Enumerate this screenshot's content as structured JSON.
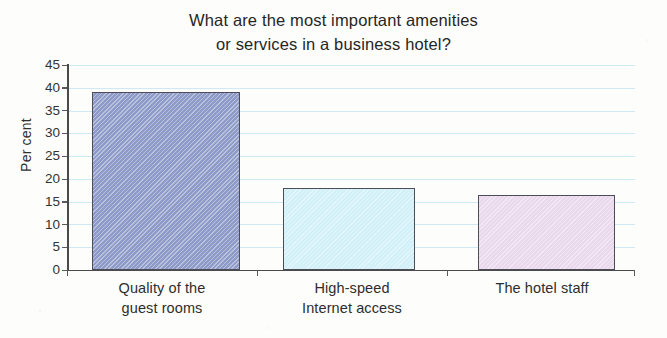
{
  "chart_data": {
    "type": "bar",
    "title": "What are the most important amenities\nor services in a business hotel?",
    "title_line1": "What are the most important amenities",
    "title_line2": "or services in a business hotel?",
    "xlabel": "",
    "ylabel": "Per cent",
    "ylim": [
      0,
      45
    ],
    "ytick_step": 5,
    "yticks": [
      "45",
      "40",
      "35",
      "30",
      "25",
      "20",
      "15",
      "10",
      "5",
      "0"
    ],
    "grid": true,
    "grid_axis": "y",
    "legend": false,
    "categories": [
      "Quality of the\nguest rooms",
      "High-speed\nInternet access",
      "The hotel staff"
    ],
    "values": [
      39,
      18,
      16.5
    ],
    "bar_colors": [
      "#8e9bc8",
      "#d2f0f8",
      "#ead9ed"
    ],
    "bar_edge_color": "#4d4d57",
    "gridline_color": "#cfeaf3",
    "axis_color": "#4a4a4a",
    "background_color": "#fdfdfb",
    "text_color": "#2a2a2a"
  }
}
